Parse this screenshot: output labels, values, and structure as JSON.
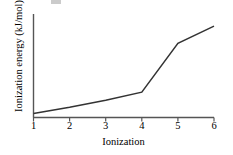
{
  "figure": {
    "background_color": "#ffffff",
    "line_color": "#333333",
    "axis_color": "#555555"
  },
  "chart_data": {
    "type": "line",
    "title": "",
    "subtitle": "",
    "xlabel": "Ionization",
    "ylabel": "Ionization energy (kJ/mol)",
    "categories": [
      "1",
      "2",
      "3",
      "4",
      "5",
      "6"
    ],
    "x": [
      1,
      2,
      3,
      4,
      5,
      6
    ],
    "values": [
      0.04,
      0.1,
      0.17,
      0.25,
      0.73,
      0.9
    ],
    "xtick_labels": [
      "1",
      "2",
      "3",
      "4",
      "5",
      "6"
    ],
    "ytick_labels": [],
    "xlim": [
      1,
      6
    ],
    "ylim": [
      0,
      1
    ],
    "grid": false,
    "legend": false,
    "legend_position": "none",
    "annotations": []
  },
  "axes": {
    "y_axis_label": "Ionization energy (kJ/mol)",
    "x_axis_label": "Ionization"
  }
}
